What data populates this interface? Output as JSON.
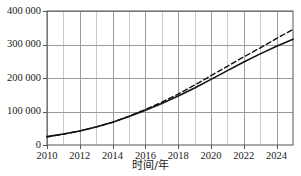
{
  "chart_data": {
    "type": "line",
    "title": "",
    "xlabel": "时间/年",
    "ylabel": "",
    "xlim": [
      2010,
      2025
    ],
    "ylim": [
      0,
      400000
    ],
    "grid": true,
    "legend": "none",
    "x_tick_labels": [
      "2010",
      "2012",
      "2014",
      "2016",
      "2018",
      "2020",
      "2022",
      "2024"
    ],
    "x_tick_values": [
      2010,
      2012,
      2014,
      2016,
      2018,
      2020,
      2022,
      2024
    ],
    "x_minor_ticks": [
      2011,
      2013,
      2015,
      2017,
      2019,
      2021,
      2023,
      2025
    ],
    "y_tick_labels": [
      "0",
      "100 000",
      "200 000",
      "300 000",
      "400 000"
    ],
    "y_tick_values": [
      0,
      100000,
      200000,
      300000,
      400000
    ],
    "x": [
      2010,
      2011,
      2012,
      2013,
      2014,
      2015,
      2016,
      2017,
      2018,
      2019,
      2020,
      2021,
      2022,
      2023,
      2024,
      2025
    ],
    "series": [
      {
        "name": "实线",
        "style": "solid",
        "color": "#111111",
        "values": [
          25000,
          33000,
          42000,
          54000,
          68000,
          85000,
          104000,
          124000,
          146000,
          170000,
          196000,
          222000,
          248000,
          272000,
          295000,
          316000
        ]
      },
      {
        "name": "虚线",
        "style": "dashed",
        "color": "#111111",
        "values": [
          24000,
          32000,
          42000,
          54000,
          68000,
          86000,
          106000,
          128000,
          152000,
          179000,
          207000,
          235000,
          263000,
          290000,
          318000,
          345000
        ]
      }
    ],
    "axis_color": "#555555",
    "grid_color": "#b8b8b8",
    "background": "#ffffff"
  },
  "layout": {
    "plot_left": 47,
    "plot_right": 293,
    "plot_top": 11,
    "plot_bottom": 145
  }
}
